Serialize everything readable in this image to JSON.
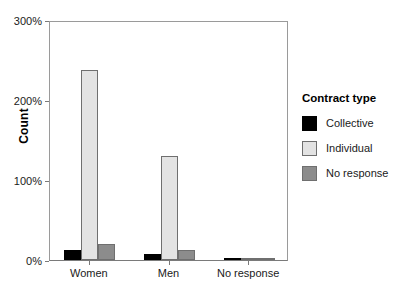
{
  "chart_data": {
    "type": "bar",
    "title": "",
    "xlabel": "",
    "ylabel": "Count",
    "categories": [
      "Women",
      "Men",
      "No response"
    ],
    "series": [
      {
        "name": "Collective",
        "color": "#000000",
        "values": [
          13,
          7,
          1
        ]
      },
      {
        "name": "Individual",
        "color": "#e3e3e3",
        "values": [
          238,
          130,
          3
        ]
      },
      {
        "name": "No response",
        "color": "#8c8c8c",
        "values": [
          20,
          12,
          2
        ]
      }
    ],
    "ylim": [
      0,
      300
    ],
    "ytick_values": [
      0,
      100,
      200,
      300
    ],
    "ytick_labels": [
      "0%",
      "100%",
      "200%",
      "300%"
    ],
    "grid": false,
    "legend_position": "right",
    "legend_title": "Contract type"
  },
  "axis": {
    "y_label": "Count",
    "y_ticks": [
      "0%",
      "100%",
      "200%",
      "300%"
    ],
    "x_ticks": [
      "Women",
      "Men",
      "No response"
    ]
  },
  "legend": {
    "title": "Contract type",
    "items": [
      {
        "label": "Collective",
        "color": "#000000"
      },
      {
        "label": "Individual",
        "color": "#e3e3e3"
      },
      {
        "label": "No response",
        "color": "#8c8c8c"
      }
    ]
  }
}
